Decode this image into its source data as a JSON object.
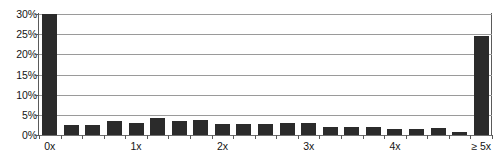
{
  "chart_data": {
    "type": "bar",
    "title": "",
    "xlabel": "",
    "ylabel": "",
    "ylim": [
      0,
      30
    ],
    "y_tick_labels": [
      "0%",
      "5%",
      "10%",
      "15%",
      "20%",
      "25%",
      "30%"
    ],
    "y_tick_values": [
      0,
      5,
      10,
      15,
      20,
      25,
      30
    ],
    "x_tick_labels": [
      "0x",
      "1x",
      "2x",
      "3x",
      "4x",
      "≥ 5x"
    ],
    "x_tick_indices": [
      0,
      4,
      8,
      12,
      16,
      20
    ],
    "grid": "horizontal",
    "legend": "none",
    "bar_color": "#2b2b2b",
    "categories": [
      "0x",
      "0.25x",
      "0.5x",
      "0.75x",
      "1x",
      "1.25x",
      "1.5x",
      "1.75x",
      "2x",
      "2.25x",
      "2.5x",
      "2.75x",
      "3x",
      "3.25x",
      "3.5x",
      "3.75x",
      "4x",
      "4.25x",
      "4.5x",
      "4.75x",
      "≥ 5x"
    ],
    "values": [
      30.0,
      2.6,
      2.6,
      3.4,
      3.0,
      4.3,
      3.5,
      3.8,
      2.7,
      2.8,
      2.7,
      2.9,
      3.0,
      2.1,
      2.1,
      2.1,
      1.6,
      1.6,
      1.7,
      0.8,
      24.5
    ]
  }
}
